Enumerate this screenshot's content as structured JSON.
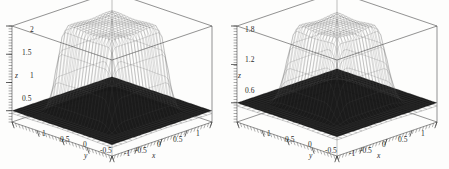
{
  "figure": {
    "background_color": "#fdfdfc",
    "ink_color": "#2b2b2b",
    "mesh_color": "#141414",
    "under_mesh_color": "#8d8d8d",
    "panel_count": 2
  },
  "chart_data": [
    {
      "type": "surface",
      "panel": "left",
      "title": "",
      "xlabel": "x",
      "ylabel": "y",
      "zlabel": "z",
      "xlim": [
        -1,
        1
      ],
      "ylim": [
        -1,
        1
      ],
      "zlim": [
        0.3,
        2.0
      ],
      "grid": false,
      "legend": "none",
      "projection": "3d-box-wireframe",
      "x_ticks": [
        -1,
        -0.5,
        0,
        0.5,
        1
      ],
      "x_tick_labels": [
        "-1",
        "-0.5",
        "0",
        "0.5",
        "1"
      ],
      "y_ticks": [
        1,
        0.5,
        0,
        -0.5,
        -1
      ],
      "y_tick_labels": [
        "1",
        "0.5",
        "0",
        "-0.5",
        "-1"
      ],
      "z_ticks": [
        0.5,
        1,
        1.5,
        2
      ],
      "z_tick_labels": [
        "0.5",
        "1",
        "1.5",
        "2"
      ],
      "description": "Dark wireframe mesh plateau surface rising from a low flat skirt near z=0.5 to a broad flat top near z=2, with steep rounded sidewalls; a lighter secondary mesh surface is visible underneath near the base.",
      "surface": {
        "plateau_level": 2.0,
        "base_level": 0.5,
        "plateau_half_width": 0.45,
        "transition_width": 0.3,
        "mesh_nx": 33,
        "mesh_ny": 33
      },
      "under_surface": {
        "peak_level": 0.95,
        "base_level": 0.45,
        "mesh_nx": 21,
        "mesh_ny": 21
      }
    },
    {
      "type": "surface",
      "panel": "right",
      "title": "",
      "xlabel": "x",
      "ylabel": "y",
      "zlabel": "z",
      "xlim": [
        -1,
        1
      ],
      "ylim": [
        -1,
        1
      ],
      "zlim": [
        0.3,
        1.8
      ],
      "grid": false,
      "legend": "none",
      "projection": "3d-box-wireframe",
      "x_ticks": [
        -1,
        -0.5,
        0,
        0.5,
        1
      ],
      "x_tick_labels": [
        "-1",
        "-0.5",
        "0",
        "0.5",
        "1"
      ],
      "y_ticks": [
        1,
        0.5,
        0,
        -0.5,
        -1
      ],
      "y_tick_labels": [
        "1",
        "0.5",
        "0",
        "-0.5",
        "-1"
      ],
      "z_ticks": [
        0.6,
        1.2,
        1.8
      ],
      "z_tick_labels": [
        "0.6",
        "1.2",
        "1.8"
      ],
      "description": "Dark wireframe mesh plateau surface with a rounded dome-like top near z=1.8 falling to a flat skirt near z=0.6; a lighter secondary mesh surface is visible underneath near the base.",
      "surface": {
        "plateau_level": 1.8,
        "base_level": 0.6,
        "plateau_half_width": 0.38,
        "transition_width": 0.36,
        "mesh_nx": 33,
        "mesh_ny": 33
      },
      "under_surface": {
        "peak_level": 1.0,
        "base_level": 0.55,
        "mesh_nx": 21,
        "mesh_ny": 21
      }
    }
  ],
  "panels": [
    {
      "id": "left",
      "z_tick_labels": [
        "2",
        "1.5",
        "1",
        "0.5"
      ],
      "z_axis_name": "z",
      "y_tick_labels": [
        "1",
        "0.5",
        "0",
        "-0.5"
      ],
      "y_axis_name": "y",
      "x_corner_label": "-1",
      "x_tick_labels": [
        "-0.5",
        "0",
        "0.5",
        "1"
      ],
      "x_axis_name": "x"
    },
    {
      "id": "right",
      "z_tick_labels": [
        "1.8",
        "1.2",
        "0.6"
      ],
      "z_axis_name": "z",
      "y_tick_labels": [
        "1",
        "0.5",
        "0",
        "-0.5"
      ],
      "y_axis_name": "y",
      "x_corner_label": "-1",
      "x_tick_labels": [
        "-0.5",
        "0",
        "0.5",
        "1"
      ],
      "x_axis_name": "x"
    }
  ]
}
